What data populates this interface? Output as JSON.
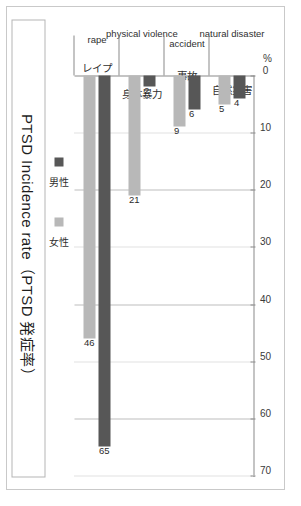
{
  "figure": {
    "title": "PTSD Incidence rate（PTSD 発症率）",
    "axis_unit_label": "%"
  },
  "legend": {
    "position": "left",
    "items": [
      {
        "label": "男性",
        "color": "#575757",
        "key": "male"
      },
      {
        "label": "女性",
        "color": "#b8b8b8",
        "key": "female"
      }
    ]
  },
  "chart_data": {
    "type": "bar",
    "orientation": "horizontal-rotated",
    "title": "PTSD Incidence rate（PTSD 発症率）",
    "xlabel": "%",
    "ylabel": "",
    "xlim": [
      0,
      70
    ],
    "xticks": [
      0,
      10,
      20,
      30,
      40,
      50,
      60,
      70
    ],
    "xtick_labels": [
      "0",
      "10",
      "20",
      "30",
      "40",
      "50",
      "60",
      "70"
    ],
    "grid": true,
    "categories": [
      {
        "en": "natural disaster",
        "jp": "自然災害"
      },
      {
        "en": "accident",
        "jp": "事故"
      },
      {
        "en": "physical violence",
        "jp": "身体暴力"
      },
      {
        "en": "rape",
        "jp": "レイプ"
      }
    ],
    "series": [
      {
        "name": "男性",
        "key": "male",
        "color": "#575757",
        "values": [
          4,
          6,
          2,
          65
        ]
      },
      {
        "name": "女性",
        "key": "female",
        "color": "#b8b8b8",
        "values": [
          5,
          9,
          21,
          46
        ]
      }
    ],
    "data_labels": {
      "male": [
        "4",
        "6",
        "2",
        "65"
      ],
      "female": [
        "5",
        "9",
        "21",
        "46"
      ]
    }
  }
}
